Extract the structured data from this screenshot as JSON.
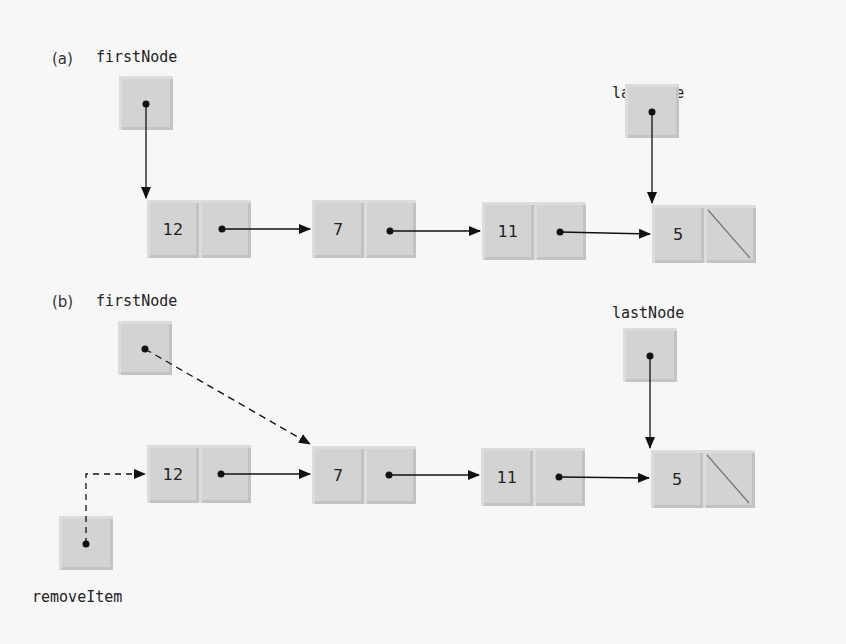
{
  "diagram": {
    "type": "singly-linked-list-removal",
    "parts": [
      {
        "id": "a",
        "label": "(a)",
        "first_ref_label": "firstNode",
        "last_ref_label": "lastNode",
        "nodes": [
          {
            "value": "12"
          },
          {
            "value": "7"
          },
          {
            "value": "11"
          },
          {
            "value": "5",
            "next": "null"
          }
        ]
      },
      {
        "id": "b",
        "label": "(b)",
        "first_ref_label": "firstNode",
        "last_ref_label": "lastNode",
        "remove_ref_label": "removeItem",
        "nodes": [
          {
            "value": "12"
          },
          {
            "value": "7"
          },
          {
            "value": "11"
          },
          {
            "value": "5",
            "next": "null"
          }
        ],
        "dashed_links": [
          "firstNode -> node 7",
          "removeItem -> node 12"
        ]
      }
    ],
    "colors": {
      "box_fill": "#d3d3d3",
      "line": "#111111",
      "background": "#f7f7f7"
    }
  }
}
